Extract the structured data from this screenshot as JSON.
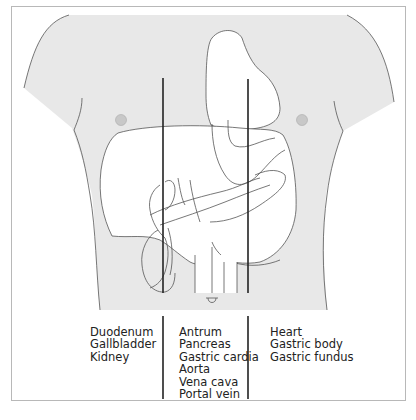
{
  "figure": {
    "type": "anatomical-diagram",
    "colors": {
      "body_fill": "#e8e8e8",
      "organ_fill": "#ffffff",
      "outline": "#555555",
      "reference_line": "#222222",
      "nipple": "#c8c8c8",
      "frame": "#b8b8b8"
    }
  },
  "columns": [
    {
      "position": "left",
      "items": [
        "Duodenum",
        "Gallbladder",
        "Kidney"
      ]
    },
    {
      "position": "middle",
      "items": [
        "Antrum",
        "Pancreas",
        "Gastric cardia",
        "Aorta",
        "Vena cava",
        "Portal vein"
      ]
    },
    {
      "position": "right",
      "items": [
        "Heart",
        "Gastric body",
        "Gastric fundus"
      ]
    }
  ]
}
